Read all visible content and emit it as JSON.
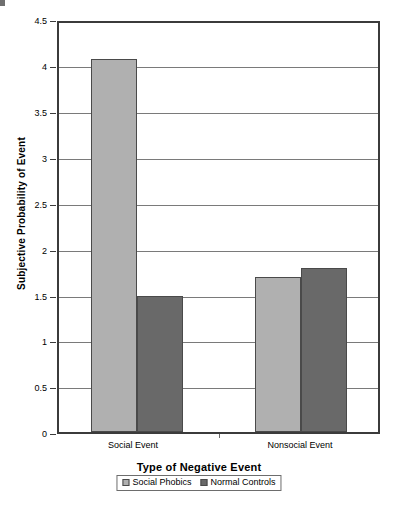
{
  "chart_data": {
    "type": "bar",
    "title": "",
    "xlabel": "Type of Negative Event",
    "ylabel": "Subjective Probability of Event",
    "categories": [
      "Social Event",
      "Nonsocial Event"
    ],
    "series": [
      {
        "name": "Social Phobics",
        "values": [
          4.1,
          1.7
        ],
        "color": "#b0b0b0"
      },
      {
        "name": "Normal Controls",
        "values": [
          1.5,
          1.8
        ],
        "color": "#696969"
      }
    ],
    "ylim": [
      0,
      4.5
    ],
    "yticks": [
      "0",
      "0.5",
      "1",
      "1.5",
      "2",
      "2.5",
      "3",
      "3.5",
      "4",
      "4.5"
    ],
    "ytick_values": [
      0,
      0.5,
      1,
      1.5,
      2,
      2.5,
      3,
      3.5,
      4,
      4.5
    ],
    "grid": true,
    "grid_axis": "y",
    "legend_position": "bottom",
    "legend_entries": [
      "Social Phobics",
      "Normal Controls"
    ]
  },
  "axes": {
    "y_title": "Subjective Probability of Event",
    "x_title": "Type of Negative Event",
    "y_tick_0": "0",
    "y_tick_1": "0.5",
    "y_tick_2": "1",
    "y_tick_3": "1.5",
    "y_tick_4": "2",
    "y_tick_5": "2.5",
    "y_tick_6": "3",
    "y_tick_7": "3.5",
    "y_tick_8": "4",
    "y_tick_9": "4.5",
    "x_tick_0": "Social Event",
    "x_tick_1": "Nonsocial Event"
  },
  "legend": {
    "entry_0": "Social Phobics",
    "entry_1": "Normal Controls"
  }
}
